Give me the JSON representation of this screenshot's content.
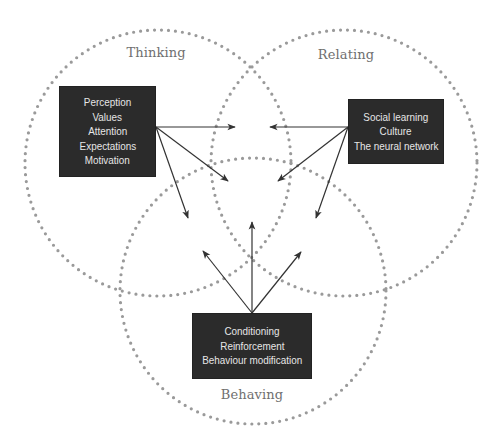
{
  "diagram": {
    "colors": {
      "circle_dots": "#9a9a9a",
      "box_fill": "#2b2b2b",
      "box_text": "#e6e6e6",
      "arrow": "#333333",
      "label_text": "#6f6f6f",
      "background": "#ffffff"
    },
    "circles": [
      {
        "id": "thinking",
        "label": "Thinking",
        "box_items": [
          "Perception",
          "Values",
          "Attention",
          "Expectations",
          "Motivation"
        ]
      },
      {
        "id": "relating",
        "label": "Relating",
        "box_items": [
          "Social learning",
          "Culture",
          "The neural network"
        ]
      },
      {
        "id": "behaving",
        "label": "Behaving",
        "box_items": [
          "Conditioning",
          "Reinforcement",
          "Behaviour modification"
        ]
      }
    ]
  }
}
